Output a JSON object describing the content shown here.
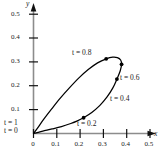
{
  "chart_data": {
    "type": "line",
    "title": "",
    "subtitle": "",
    "xlabel": "x",
    "ylabel": "y",
    "xlim": [
      0,
      0.55
    ],
    "ylim": [
      0,
      0.55
    ],
    "grid": false,
    "legend": null,
    "x_ticks": [
      "0",
      "0.1",
      "0.2",
      "0.3",
      "0.4",
      "0.5"
    ],
    "x_tick_values": [
      0,
      0.1,
      0.2,
      0.3,
      0.4,
      0.5
    ],
    "y_ticks": [
      "0.1",
      "0.2",
      "0.3",
      "0.4",
      "0.5"
    ],
    "y_tick_values": [
      0.1,
      0.2,
      0.3,
      0.4,
      0.5
    ],
    "series": [
      {
        "name": "parametric-loop",
        "closed": true,
        "points": [
          [
            0.0,
            0.0
          ],
          [
            0.012,
            0.003
          ],
          [
            0.04,
            0.01
          ],
          [
            0.08,
            0.019
          ],
          [
            0.12,
            0.029
          ],
          [
            0.16,
            0.042
          ],
          [
            0.186,
            0.052
          ],
          [
            0.215,
            0.066
          ],
          [
            0.25,
            0.088
          ],
          [
            0.285,
            0.118
          ],
          [
            0.315,
            0.152
          ],
          [
            0.34,
            0.19
          ],
          [
            0.358,
            0.228
          ],
          [
            0.372,
            0.262
          ],
          [
            0.378,
            0.29
          ],
          [
            0.374,
            0.308
          ],
          [
            0.36,
            0.318
          ],
          [
            0.34,
            0.32
          ],
          [
            0.312,
            0.313
          ],
          [
            0.275,
            0.296
          ],
          [
            0.235,
            0.268
          ],
          [
            0.195,
            0.233
          ],
          [
            0.155,
            0.192
          ],
          [
            0.115,
            0.148
          ],
          [
            0.078,
            0.103
          ],
          [
            0.045,
            0.061
          ],
          [
            0.018,
            0.024
          ],
          [
            0.0,
            0.0
          ]
        ]
      }
    ],
    "markers": [
      {
        "t": "0.2",
        "x": 0.215,
        "y": 0.066
      },
      {
        "t": "0.4",
        "x": 0.358,
        "y": 0.228
      },
      {
        "t": "0.6",
        "x": 0.378,
        "y": 0.29
      },
      {
        "t": "0.8",
        "x": 0.312,
        "y": 0.313
      },
      {
        "t": "0",
        "x": 0.0,
        "y": 0.0
      },
      {
        "t": "1",
        "x": 0.0,
        "y": 0.0
      }
    ],
    "annotations": [
      {
        "id": "t-0-8",
        "text": "t = 0.8",
        "tvar": "t",
        "rest": " = 0.8"
      },
      {
        "id": "t-0-6",
        "text": "t = 0.6",
        "tvar": "t",
        "rest": " = 0.6"
      },
      {
        "id": "t-0-4",
        "text": "t = 0.4",
        "tvar": "t",
        "rest": " = 0.4"
      },
      {
        "id": "t-0-2",
        "text": "t = 0.2",
        "tvar": "t",
        "rest": " = 0.2"
      },
      {
        "id": "t-1",
        "text": "t = 1",
        "tvar": "t",
        "rest": " = 1"
      },
      {
        "id": "t-0",
        "text": "t = 0",
        "tvar": "t",
        "rest": " = 0"
      }
    ],
    "colors": {
      "curve": "#000000",
      "axis": "#8c8c8c",
      "axis_arrow": "#000000",
      "text": "#1a1a1a",
      "marker": "#000000",
      "background": "#ffffff"
    }
  },
  "labels": {
    "y_axis_name": "y",
    "x_axis_name": "x",
    "y_05": "0.5",
    "y_04": "0.4",
    "y_03": "0.3",
    "y_02": "0.2",
    "y_01": "0.1",
    "x_0": "0",
    "x_01": "0.1",
    "x_02": "0.2",
    "x_03": "0.3",
    "x_04": "0.4",
    "x_05": "0.5",
    "t_08": "t = 0.8",
    "t_06": "t = 0.6",
    "t_04": "t = 0.4",
    "t_02": "t = 0.2",
    "t_1": "t = 1",
    "t_0": "t = 0"
  }
}
